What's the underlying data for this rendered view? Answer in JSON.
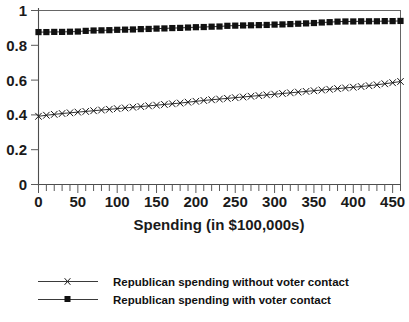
{
  "chart_data": {
    "type": "line",
    "title": "",
    "xlabel": "Spending (in $100,000s)",
    "ylabel": "",
    "xlim": [
      0,
      460
    ],
    "ylim": [
      0,
      1
    ],
    "grid": false,
    "legend_position": "bottom",
    "x_ticks": [
      0,
      50,
      100,
      150,
      200,
      250,
      300,
      350,
      400,
      450
    ],
    "x_tick_labels": [
      "0",
      "50",
      "100",
      "150",
      "200",
      "250",
      "300",
      "350",
      "400",
      "450"
    ],
    "x_minor_tick_step": 10,
    "y_ticks": [
      0,
      0.2,
      0.4,
      0.6,
      0.8,
      1
    ],
    "y_tick_labels": [
      "0",
      "0.2",
      "0.4",
      "0.6",
      "0.8",
      "1"
    ],
    "x": [
      0,
      10,
      20,
      30,
      40,
      50,
      60,
      70,
      80,
      90,
      100,
      110,
      120,
      130,
      140,
      150,
      160,
      170,
      180,
      190,
      200,
      210,
      220,
      230,
      240,
      250,
      260,
      270,
      280,
      290,
      300,
      310,
      320,
      330,
      340,
      350,
      360,
      370,
      380,
      390,
      400,
      410,
      420,
      430,
      440,
      450,
      460
    ],
    "series": [
      {
        "name": "Republican spending without voter contact",
        "marker": "x",
        "values": [
          0.392,
          0.398,
          0.403,
          0.408,
          0.412,
          0.416,
          0.42,
          0.424,
          0.428,
          0.432,
          0.436,
          0.44,
          0.444,
          0.448,
          0.452,
          0.456,
          0.46,
          0.464,
          0.468,
          0.473,
          0.478,
          0.483,
          0.487,
          0.491,
          0.495,
          0.499,
          0.503,
          0.507,
          0.511,
          0.515,
          0.519,
          0.523,
          0.527,
          0.531,
          0.535,
          0.539,
          0.543,
          0.547,
          0.551,
          0.555,
          0.559,
          0.563,
          0.568,
          0.573,
          0.579,
          0.585,
          0.592
        ]
      },
      {
        "name": "Republican spending with voter contact",
        "marker": "square",
        "values": [
          0.876,
          0.876,
          0.877,
          0.877,
          0.878,
          0.879,
          0.883,
          0.885,
          0.886,
          0.887,
          0.889,
          0.89,
          0.891,
          0.893,
          0.894,
          0.896,
          0.897,
          0.899,
          0.9,
          0.902,
          0.904,
          0.905,
          0.907,
          0.908,
          0.912,
          0.913,
          0.914,
          0.915,
          0.916,
          0.917,
          0.919,
          0.92,
          0.922,
          0.924,
          0.926,
          0.928,
          0.931,
          0.933,
          0.936,
          0.937,
          0.937,
          0.938,
          0.938,
          0.938,
          0.939,
          0.939,
          0.94
        ]
      }
    ]
  },
  "legend": {
    "entries": [
      {
        "label": "Republican spending without voter contact",
        "marker": "x"
      },
      {
        "label": "Republican spending with voter contact",
        "marker": "square"
      }
    ]
  },
  "colors": {
    "series_1": "#1a1a1a",
    "series_2": "#111111",
    "axis": "#4d4d4d",
    "background": "#ffffff"
  }
}
